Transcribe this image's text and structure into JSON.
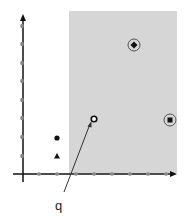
{
  "diagram": {
    "label_q": "q",
    "colors": {
      "shade": "#d6d6d6",
      "axis": "#111111",
      "tick": "#888888",
      "marker": "#111111",
      "ring": "#666666"
    },
    "shaded_region": {
      "x1": 69,
      "y1": 11,
      "x2": 177,
      "y2": 173
    },
    "x_ticks": [
      39,
      57,
      76,
      94,
      112,
      130,
      148,
      166
    ],
    "y_ticks": [
      26,
      44,
      63,
      81,
      100,
      118,
      137,
      156
    ],
    "points": [
      {
        "name": "q",
        "shape": "open-circle",
        "x": 94,
        "y": 119
      },
      {
        "name": "circled-diamond",
        "shape": "diamond",
        "x": 134,
        "y": 45
      },
      {
        "name": "circled-square",
        "shape": "square",
        "x": 170,
        "y": 119
      },
      {
        "name": "dot",
        "shape": "dot",
        "x": 57,
        "y": 137
      },
      {
        "name": "triangle",
        "shape": "triangle",
        "x": 57,
        "y": 156
      }
    ]
  }
}
